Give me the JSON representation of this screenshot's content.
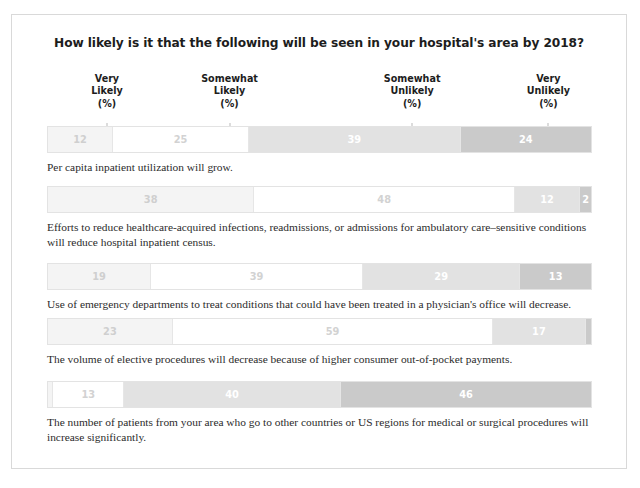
{
  "figure": {
    "title": "How likely is it that the following will be seen in your hospital's area by 2018?"
  },
  "columns": [
    {
      "line1": "Very",
      "line2": "Likely",
      "line3": "(%)",
      "center_pct": 11.0
    },
    {
      "line1": "Somewhat",
      "line2": "Likely",
      "line3": "(%)",
      "center_pct": 33.5
    },
    {
      "line1": "Somewhat",
      "line2": "Unlikely",
      "line3": "(%)",
      "center_pct": 67.0
    },
    {
      "line1": "Very",
      "line2": "Unlikely",
      "line3": "(%)",
      "center_pct": 92.0
    }
  ],
  "rows": [
    {
      "values": [
        12,
        25,
        39,
        24
      ],
      "labels": [
        "12",
        "25",
        "39",
        "24"
      ],
      "caption": "Per capita inpatient utilization will grow."
    },
    {
      "values": [
        38,
        48,
        12,
        2
      ],
      "labels": [
        "38",
        "48",
        "12",
        "2"
      ],
      "caption": "Efforts to reduce healthcare-acquired infections, readmissions, or admissions for ambulatory care–sensitive conditions will reduce hospital inpatient census."
    },
    {
      "values": [
        19,
        39,
        29,
        13
      ],
      "labels": [
        "19",
        "39",
        "29",
        "13"
      ],
      "caption": "Use of emergency departments to treat conditions that could have been treated in a physician's office will decrease."
    },
    {
      "values": [
        23,
        59,
        17,
        1
      ],
      "labels": [
        "23",
        "59",
        "17",
        ""
      ],
      "caption": "The volume of elective procedures will decrease because of higher consumer out-of-pocket payments."
    },
    {
      "values": [
        1,
        13,
        40,
        46
      ],
      "labels": [
        "",
        "13",
        "40",
        "46"
      ],
      "caption": "The number of patients from your area who go to other countries or US regions for medical or surgical procedures will increase significantly."
    }
  ],
  "chart_data": {
    "type": "bar",
    "title": "How likely is it that the following will be seen in your hospital's area by 2018?",
    "xlabel": "",
    "ylabel": "",
    "xlim": [
      0,
      100
    ],
    "grid": false,
    "legend_position": "top",
    "orientation": "horizontal",
    "stacked": true,
    "units": "percent",
    "categories": [
      "Per capita inpatient utilization will grow.",
      "Efforts to reduce healthcare-acquired infections, readmissions, or admissions for ambulatory care–sensitive conditions will reduce hospital inpatient census.",
      "Use of emergency departments to treat conditions that could have been treated in a physician's office will decrease.",
      "The volume of elective procedures will decrease because of higher consumer out-of-pocket payments.",
      "The number of patients from your area who go to other countries or US regions for medical or surgical procedures will increase significantly."
    ],
    "series": [
      {
        "name": "Very Likely (%)",
        "values": [
          12,
          38,
          19,
          23,
          1
        ],
        "color": "#f4f4f4"
      },
      {
        "name": "Somewhat Likely (%)",
        "values": [
          25,
          48,
          39,
          59,
          13
        ],
        "color": "#ffffff"
      },
      {
        "name": "Somewhat Unlikely (%)",
        "values": [
          39,
          12,
          29,
          17,
          40
        ],
        "color": "#e2e2e2"
      },
      {
        "name": "Very Unlikely (%)",
        "values": [
          24,
          2,
          13,
          1,
          46
        ],
        "color": "#cacaca"
      }
    ]
  },
  "colors": {
    "frame_border": "#d9d9d9",
    "tone_1": "#f4f4f4",
    "tone_2": "#ffffff",
    "tone_3": "#e2e2e2",
    "tone_4": "#cacaca",
    "title_text": "#1d1d1d",
    "caption_text": "#2b2b2b"
  }
}
